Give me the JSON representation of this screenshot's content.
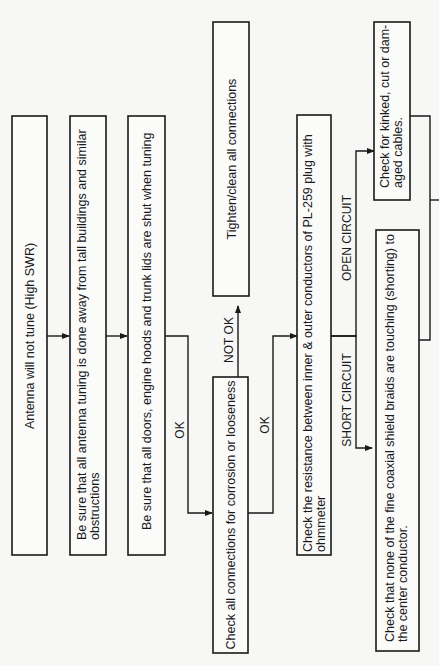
{
  "header": {
    "text": ""
  },
  "nodes": {
    "start": {
      "lines": [
        "Antenna will not tune (High SWR)"
      ]
    },
    "obstructions": {
      "lines": [
        "Be sure that all antenna tuning is done away from tall buildings and similar",
        "obstructions"
      ]
    },
    "doors": {
      "lines": [
        "Be sure that all doors, engine hoods and trunk lids are shut when tuning"
      ]
    },
    "check_connections": {
      "lines": [
        "Check all connections for corrosion or looseness"
      ]
    },
    "tighten": {
      "lines": [
        "Tighten/clean all connections"
      ]
    },
    "resistance": {
      "lines": [
        "Check the resistance between inner & outer conductors of PL-259 plug with",
        "ohmmeter"
      ]
    },
    "shield_braids": {
      "lines": [
        "Check that none of the fine coaxial shield braids are touching (shorting) to",
        "the center conductor."
      ]
    },
    "cables": {
      "lines": [
        "Check for kinked, cut or dam-",
        "aged cables."
      ]
    }
  },
  "edges": {
    "ok1": "OK",
    "not_ok": "NOT OK",
    "ok2": "OK",
    "open_circuit": "OPEN CIRCUIT",
    "short_circuit": "SHORT CIRCUIT"
  }
}
